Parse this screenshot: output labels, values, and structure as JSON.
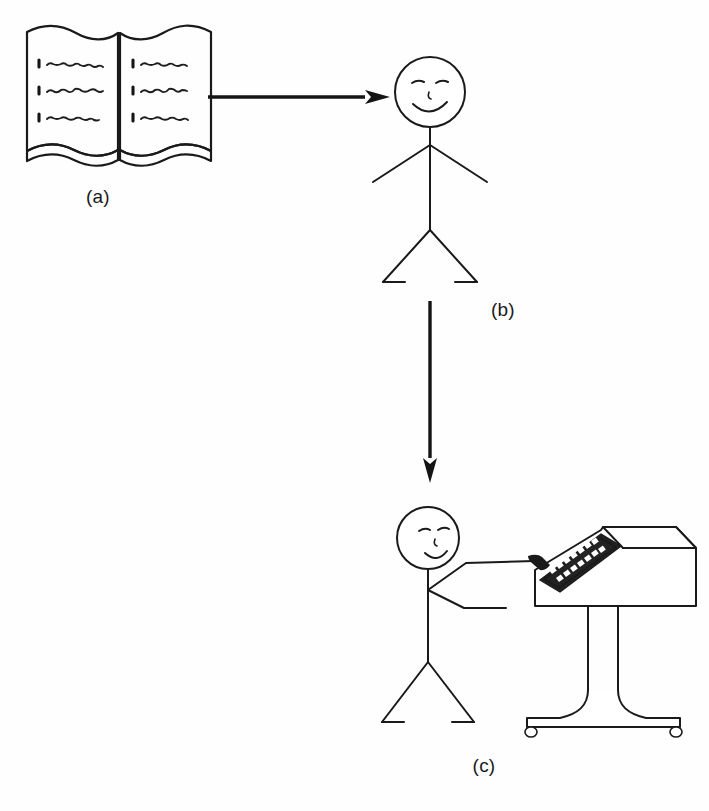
{
  "figure": {
    "background_color": "#fefefe",
    "ink_color": "#1a1a1a",
    "width": 709,
    "height": 811,
    "panels": [
      {
        "id": "a",
        "label": "(a)",
        "subject": "open-book",
        "description": "Open book with two pages, wavy top and bottom edges, three numbered lines of squiggly text on each page",
        "line_count_per_page": 3,
        "list_markers": [
          "1",
          "2",
          "3",
          "4",
          "5",
          "6"
        ]
      },
      {
        "id": "b",
        "label": "(b)",
        "subject": "stick-figure-person",
        "description": "Standing stick figure facing forward with smiling face, arms outstretched downward, legs apart with feet"
      },
      {
        "id": "c",
        "label": "(c)",
        "subject": "stick-figure-at-terminal",
        "description": "Stick figure reaching toward a pedestal-mounted computer terminal with slanted keyboard panel and castered base"
      }
    ],
    "arrows": [
      {
        "name": "book-to-person",
        "direction": "right",
        "from_panel": "a",
        "to_panel": "b"
      },
      {
        "name": "person-to-terminal",
        "direction": "down",
        "from_panel": "b",
        "to_panel": "c"
      }
    ],
    "terminal": {
      "name": "computer-terminal",
      "keyboard_rows": 2,
      "keys_per_row": 8,
      "has_casters": true,
      "caster_count": 2,
      "keyboard_panel_color": "#222222",
      "key_color": "#ffffff"
    }
  }
}
